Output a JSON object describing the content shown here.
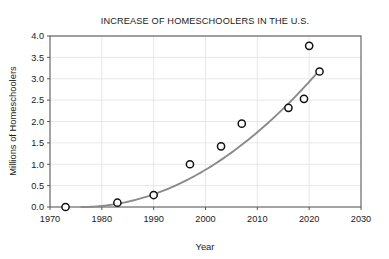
{
  "chart_data": {
    "type": "scatter",
    "title": "INCREASE OF HOMESCHOOLERS IN THE U.S.",
    "xlabel": "Year",
    "ylabel": "Millions of Homeschoolers",
    "xlim": [
      1970,
      2030
    ],
    "ylim": [
      0.0,
      4.0
    ],
    "grid": true,
    "legend": "none",
    "x_ticks": [
      "1970",
      "1980",
      "1990",
      "2000",
      "2010",
      "2020",
      "2030"
    ],
    "x_tick_values": [
      1970,
      1980,
      1990,
      2000,
      2010,
      2020,
      2030
    ],
    "y_ticks": [
      "0.0",
      "0.5",
      "1.0",
      "1.5",
      "2.0",
      "2.5",
      "3.0",
      "3.5",
      "4.0"
    ],
    "y_tick_values": [
      0.0,
      0.5,
      1.0,
      1.5,
      2.0,
      2.5,
      3.0,
      3.5,
      4.0
    ],
    "x": [
      1973,
      1983,
      1990,
      1997,
      2003,
      2007,
      2016,
      2019,
      2020,
      2022
    ],
    "values": [
      0.0,
      0.1,
      0.28,
      1.0,
      1.42,
      1.95,
      2.32,
      2.53,
      3.77,
      3.17
    ],
    "points": [
      {
        "x": 1973,
        "y": 0.0
      },
      {
        "x": 1983,
        "y": 0.1
      },
      {
        "x": 1990,
        "y": 0.28
      },
      {
        "x": 1997,
        "y": 1.0
      },
      {
        "x": 2003,
        "y": 1.42
      },
      {
        "x": 2007,
        "y": 1.95
      },
      {
        "x": 2016,
        "y": 2.32
      },
      {
        "x": 2019,
        "y": 2.53
      },
      {
        "x": 2020,
        "y": 3.77
      },
      {
        "x": 2022,
        "y": 3.17
      }
    ],
    "trend": {
      "style": "exponential-fit-curve",
      "color": "#8a8a8a",
      "x_start": 1976,
      "x_end": 2022,
      "y_start": 0.0,
      "y_end": 3.2
    },
    "colors": {
      "marker_fill": "#ffffff",
      "marker_stroke": "#111111",
      "grid": "#e2e2e2",
      "frame": "#5a5a5a",
      "text": "#1a1a1a"
    }
  }
}
